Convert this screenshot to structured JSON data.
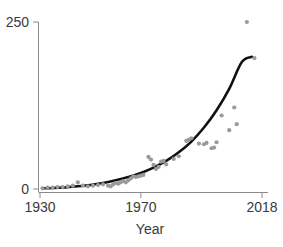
{
  "chart_data": {
    "type": "scatter",
    "title": "",
    "xlabel": "Year",
    "ylabel": "",
    "xlim": [
      1930,
      2018
    ],
    "ylim": [
      0,
      250
    ],
    "grid": false,
    "legend": null,
    "xticks": [
      1930,
      1970,
      2018
    ],
    "xtick_labels": [
      "1930",
      "1970",
      "2018"
    ],
    "yticks": [
      0,
      250
    ],
    "ytick_labels": [
      "0",
      "250"
    ],
    "point_color": "#9a9a9a",
    "line_color": "#111111",
    "axis_color": "#8a8a8a",
    "series": [
      {
        "name": "observations",
        "marker": "circle",
        "points": [
          [
            1931,
            1
          ],
          [
            1933,
            2
          ],
          [
            1935,
            2
          ],
          [
            1937,
            3
          ],
          [
            1939,
            3
          ],
          [
            1941,
            4
          ],
          [
            1943,
            5
          ],
          [
            1945,
            10
          ],
          [
            1947,
            5
          ],
          [
            1949,
            4
          ],
          [
            1951,
            5
          ],
          [
            1953,
            6
          ],
          [
            1955,
            7
          ],
          [
            1957,
            5
          ],
          [
            1958,
            4
          ],
          [
            1959,
            7
          ],
          [
            1960,
            9
          ],
          [
            1961,
            8
          ],
          [
            1962,
            10
          ],
          [
            1963,
            12
          ],
          [
            1964,
            10
          ],
          [
            1965,
            13
          ],
          [
            1966,
            16
          ],
          [
            1967,
            19
          ],
          [
            1968,
            18
          ],
          [
            1969,
            19
          ],
          [
            1970,
            20
          ],
          [
            1971,
            21
          ],
          [
            1973,
            48
          ],
          [
            1974,
            44
          ],
          [
            1975,
            36
          ],
          [
            1976,
            30
          ],
          [
            1977,
            33
          ],
          [
            1978,
            41
          ],
          [
            1979,
            42
          ],
          [
            1980,
            37
          ],
          [
            1983,
            45
          ],
          [
            1985,
            49
          ],
          [
            1988,
            72
          ],
          [
            1989,
            74
          ],
          [
            1990,
            76
          ],
          [
            1993,
            68
          ],
          [
            1995,
            67
          ],
          [
            1996,
            69
          ],
          [
            1998,
            61
          ],
          [
            1999,
            62
          ],
          [
            2000,
            70
          ],
          [
            2002,
            110
          ],
          [
            2005,
            88
          ],
          [
            2007,
            122
          ],
          [
            2008,
            97
          ],
          [
            2012,
            250
          ],
          [
            2015,
            196
          ]
        ]
      }
    ],
    "fit": {
      "name": "exponential-trend",
      "points": [
        [
          1931,
          1
        ],
        [
          1935,
          1.5
        ],
        [
          1940,
          2.5
        ],
        [
          1945,
          4
        ],
        [
          1950,
          6
        ],
        [
          1955,
          9
        ],
        [
          1960,
          13
        ],
        [
          1965,
          18
        ],
        [
          1970,
          24
        ],
        [
          1975,
          32
        ],
        [
          1980,
          42
        ],
        [
          1985,
          55
        ],
        [
          1990,
          71
        ],
        [
          1995,
          92
        ],
        [
          2000,
          118
        ],
        [
          2005,
          150
        ],
        [
          2010,
          190
        ],
        [
          2014,
          198
        ]
      ]
    }
  }
}
